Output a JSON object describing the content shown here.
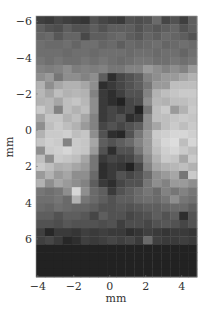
{
  "chart_data": {
    "type": "heatmap",
    "title": "",
    "xlabel": "mm",
    "ylabel": "mm",
    "xlim": [
      -4.1,
      4.85
    ],
    "ylim": [
      -6.3,
      8.1
    ],
    "y_inverted": true,
    "colormap": "gray",
    "xticks": [
      -4,
      -2,
      0,
      2,
      4
    ],
    "yticks": [
      -6,
      -4,
      -2,
      0,
      2,
      4,
      6
    ],
    "xtick_labels": [
      "−4",
      "−2",
      "0",
      "2",
      "4"
    ],
    "ytick_labels": [
      "−6",
      "−4",
      "−2",
      "0",
      "2",
      "4",
      "6"
    ],
    "grid": false,
    "legend": "none",
    "columns": 18,
    "rows": 29,
    "values": [
      [
        0.22,
        0.2,
        0.25,
        0.22,
        0.2,
        0.18,
        0.3,
        0.25,
        0.22,
        0.2,
        0.3,
        0.28,
        0.3,
        0.4,
        0.25,
        0.3,
        0.22,
        0.35
      ],
      [
        0.35,
        0.3,
        0.28,
        0.35,
        0.3,
        0.3,
        0.35,
        0.3,
        0.35,
        0.35,
        0.35,
        0.3,
        0.35,
        0.32,
        0.35,
        0.38,
        0.3,
        0.35
      ],
      [
        0.38,
        0.4,
        0.32,
        0.38,
        0.38,
        0.26,
        0.35,
        0.35,
        0.38,
        0.4,
        0.35,
        0.32,
        0.38,
        0.35,
        0.4,
        0.38,
        0.35,
        0.3
      ],
      [
        0.42,
        0.4,
        0.4,
        0.42,
        0.38,
        0.42,
        0.42,
        0.38,
        0.4,
        0.35,
        0.4,
        0.38,
        0.4,
        0.42,
        0.38,
        0.4,
        0.42,
        0.4
      ],
      [
        0.42,
        0.42,
        0.42,
        0.4,
        0.42,
        0.42,
        0.4,
        0.42,
        0.42,
        0.42,
        0.4,
        0.42,
        0.42,
        0.4,
        0.42,
        0.42,
        0.38,
        0.42
      ],
      [
        0.45,
        0.42,
        0.45,
        0.42,
        0.42,
        0.45,
        0.42,
        0.45,
        0.42,
        0.4,
        0.42,
        0.45,
        0.45,
        0.42,
        0.42,
        0.45,
        0.42,
        0.45
      ],
      [
        0.5,
        0.48,
        0.5,
        0.55,
        0.48,
        0.5,
        0.48,
        0.5,
        0.45,
        0.45,
        0.5,
        0.5,
        0.6,
        0.55,
        0.5,
        0.55,
        0.5,
        0.6
      ],
      [
        0.55,
        0.6,
        0.45,
        0.55,
        0.55,
        0.5,
        0.55,
        0.35,
        0.15,
        0.25,
        0.3,
        0.35,
        0.5,
        0.55,
        0.6,
        0.6,
        0.65,
        0.7
      ],
      [
        0.7,
        0.55,
        0.65,
        0.7,
        0.7,
        0.65,
        0.55,
        0.15,
        0.2,
        0.25,
        0.3,
        0.35,
        0.45,
        0.6,
        0.6,
        0.75,
        0.75,
        0.75
      ],
      [
        0.72,
        0.65,
        0.75,
        0.7,
        0.72,
        0.7,
        0.5,
        0.2,
        0.15,
        0.22,
        0.3,
        0.3,
        0.5,
        0.7,
        0.75,
        0.78,
        0.8,
        0.8
      ],
      [
        0.7,
        0.72,
        0.65,
        0.75,
        0.78,
        0.72,
        0.55,
        0.2,
        0.15,
        0.1,
        0.25,
        0.28,
        0.55,
        0.72,
        0.7,
        0.75,
        0.75,
        0.78
      ],
      [
        0.8,
        0.72,
        0.5,
        0.75,
        0.7,
        0.75,
        0.55,
        0.2,
        0.25,
        0.2,
        0.25,
        0.1,
        0.45,
        0.75,
        0.8,
        0.6,
        0.7,
        0.8
      ],
      [
        0.65,
        0.78,
        0.78,
        0.7,
        0.75,
        0.65,
        0.5,
        0.2,
        0.25,
        0.3,
        0.15,
        0.2,
        0.55,
        0.75,
        0.75,
        0.78,
        0.8,
        0.78
      ],
      [
        0.55,
        0.75,
        0.8,
        0.75,
        0.7,
        0.6,
        0.5,
        0.25,
        0.3,
        0.25,
        0.3,
        0.35,
        0.55,
        0.65,
        0.75,
        0.8,
        0.75,
        0.8
      ],
      [
        0.7,
        0.8,
        0.8,
        0.82,
        0.75,
        0.78,
        0.55,
        0.3,
        0.15,
        0.12,
        0.3,
        0.45,
        0.6,
        0.8,
        0.82,
        0.85,
        0.85,
        0.82
      ],
      [
        0.78,
        0.82,
        0.8,
        0.5,
        0.8,
        0.78,
        0.65,
        0.35,
        0.3,
        0.35,
        0.4,
        0.5,
        0.6,
        0.78,
        0.85,
        0.88,
        0.75,
        0.85
      ],
      [
        0.55,
        0.8,
        0.82,
        0.85,
        0.8,
        0.78,
        0.6,
        0.3,
        0.15,
        0.3,
        0.3,
        0.45,
        0.6,
        0.75,
        0.82,
        0.85,
        0.8,
        0.75
      ],
      [
        0.75,
        0.55,
        0.8,
        0.78,
        0.75,
        0.65,
        0.45,
        0.2,
        0.25,
        0.22,
        0.25,
        0.35,
        0.55,
        0.7,
        0.8,
        0.78,
        0.65,
        0.8
      ],
      [
        0.8,
        0.75,
        0.68,
        0.7,
        0.65,
        0.6,
        0.45,
        0.15,
        0.2,
        0.18,
        0.1,
        0.25,
        0.5,
        0.65,
        0.7,
        0.72,
        0.75,
        0.7
      ],
      [
        0.6,
        0.7,
        0.6,
        0.65,
        0.55,
        0.55,
        0.4,
        0.15,
        0.2,
        0.3,
        0.25,
        0.3,
        0.4,
        0.55,
        0.6,
        0.65,
        0.45,
        0.8
      ],
      [
        0.7,
        0.55,
        0.65,
        0.6,
        0.55,
        0.5,
        0.35,
        0.2,
        0.15,
        0.25,
        0.3,
        0.3,
        0.45,
        0.55,
        0.5,
        0.6,
        0.6,
        0.55
      ],
      [
        0.45,
        0.42,
        0.45,
        0.55,
        0.85,
        0.55,
        0.4,
        0.35,
        0.2,
        0.3,
        0.35,
        0.4,
        0.45,
        0.4,
        0.5,
        0.45,
        0.5,
        0.45
      ],
      [
        0.42,
        0.42,
        0.45,
        0.4,
        0.7,
        0.45,
        0.4,
        0.35,
        0.3,
        0.35,
        0.35,
        0.4,
        0.42,
        0.4,
        0.45,
        0.55,
        0.45,
        0.42
      ],
      [
        0.4,
        0.38,
        0.42,
        0.4,
        0.38,
        0.38,
        0.35,
        0.3,
        0.3,
        0.32,
        0.3,
        0.32,
        0.35,
        0.35,
        0.38,
        0.4,
        0.4,
        0.35
      ],
      [
        0.35,
        0.35,
        0.3,
        0.35,
        0.35,
        0.32,
        0.25,
        0.35,
        0.3,
        0.3,
        0.25,
        0.28,
        0.3,
        0.35,
        0.3,
        0.35,
        0.15,
        0.3
      ],
      [
        0.3,
        0.3,
        0.28,
        0.32,
        0.3,
        0.3,
        0.3,
        0.28,
        0.3,
        0.22,
        0.28,
        0.28,
        0.25,
        0.3,
        0.32,
        0.3,
        0.25,
        0.3
      ],
      [
        0.22,
        0.12,
        0.2,
        0.2,
        0.18,
        0.22,
        0.2,
        0.22,
        0.2,
        0.2,
        0.15,
        0.18,
        0.22,
        0.2,
        0.18,
        0.2,
        0.2,
        0.18
      ],
      [
        0.22,
        0.25,
        0.2,
        0.12,
        0.15,
        0.22,
        0.2,
        0.22,
        0.25,
        0.22,
        0.25,
        0.2,
        0.4,
        0.22,
        0.2,
        0.2,
        0.22,
        0.2
      ],
      [
        0.1,
        0.1,
        0.1,
        0.1,
        0.1,
        0.1,
        0.1,
        0.1,
        0.1,
        0.1,
        0.1,
        0.1,
        0.1,
        0.1,
        0.1,
        0.1,
        0.1,
        0.1
      ],
      [
        0.1,
        0.1,
        0.1,
        0.1,
        0.1,
        0.1,
        0.1,
        0.1,
        0.1,
        0.1,
        0.1,
        0.1,
        0.1,
        0.1,
        0.1,
        0.1,
        0.1,
        0.1
      ],
      [
        0.1,
        0.1,
        0.1,
        0.1,
        0.1,
        0.1,
        0.1,
        0.1,
        0.1,
        0.1,
        0.1,
        0.1,
        0.1,
        0.1,
        0.1,
        0.1,
        0.1,
        0.1
      ],
      [
        0.1,
        0.1,
        0.1,
        0.1,
        0.1,
        0.1,
        0.1,
        0.1,
        0.1,
        0.1,
        0.1,
        0.1,
        0.1,
        0.1,
        0.1,
        0.1,
        0.1,
        0.1
      ]
    ]
  }
}
